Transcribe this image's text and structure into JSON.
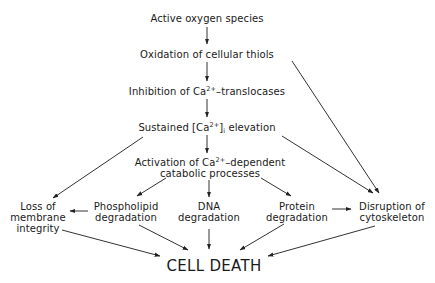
{
  "diagram": {
    "nodes": {
      "n1": {
        "label": "Active oxygen species"
      },
      "n2": {
        "label": "Oxidation of cellular thiols"
      },
      "n3": {
        "pre": "Inhibition of Ca",
        "sup": "2+",
        "post": "–translocases"
      },
      "n4": {
        "pre": "Sustained [Ca",
        "sup": "2+",
        "mid": "]",
        "sub": "i",
        "post": " elevation"
      },
      "n5": {
        "line1_pre": "Activation of Ca",
        "sup": "2+",
        "line1_post": "–dependent",
        "line2": "catabolic processes"
      },
      "n6": {
        "line1": "Loss of",
        "line2": "membrane",
        "line3": "integrity"
      },
      "n7": {
        "line1": "Phospholipid",
        "line2": "degradation"
      },
      "n8": {
        "line1": "DNA",
        "line2": "degradation"
      },
      "n9": {
        "line1": "Protein",
        "line2": "degradation"
      },
      "n10": {
        "line1": "Disruption of",
        "line2": "cytoskeleton"
      },
      "n11": {
        "label": "CELL DEATH"
      }
    },
    "edges": [
      {
        "from": "n1",
        "to": "n2"
      },
      {
        "from": "n2",
        "to": "n3"
      },
      {
        "from": "n2",
        "to": "n10"
      },
      {
        "from": "n3",
        "to": "n4"
      },
      {
        "from": "n4",
        "to": "n5"
      },
      {
        "from": "n4",
        "to": "n6"
      },
      {
        "from": "n4",
        "to": "n10"
      },
      {
        "from": "n5",
        "to": "n7"
      },
      {
        "from": "n5",
        "to": "n8"
      },
      {
        "from": "n5",
        "to": "n9"
      },
      {
        "from": "n7",
        "to": "n6"
      },
      {
        "from": "n9",
        "to": "n10"
      },
      {
        "from": "n6",
        "to": "n11"
      },
      {
        "from": "n7",
        "to": "n11"
      },
      {
        "from": "n8",
        "to": "n11"
      },
      {
        "from": "n9",
        "to": "n11"
      },
      {
        "from": "n10",
        "to": "n11"
      }
    ]
  }
}
